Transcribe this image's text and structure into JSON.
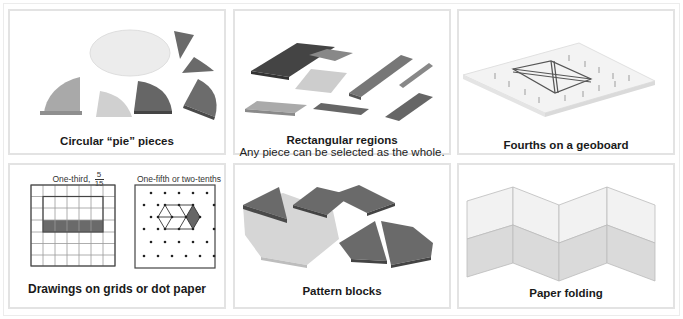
{
  "panels": [
    {
      "id": "pie",
      "caption": "Circular “pie” pieces"
    },
    {
      "id": "rect",
      "caption": "Rectangular regions",
      "subcaption": "Any piece can be selected as the whole."
    },
    {
      "id": "geoboard",
      "caption": "Fourths on a geoboard"
    },
    {
      "id": "grids",
      "caption": "Drawings on grids or dot paper",
      "grid_label": "One-third,",
      "grid_fraction": {
        "numerator": "5",
        "denominator": "15"
      },
      "dot_label": "One-fifth or two-tenths"
    },
    {
      "id": "pattern",
      "caption": "Pattern blocks"
    },
    {
      "id": "folding",
      "caption": "Paper folding"
    }
  ],
  "colors": {
    "dark": "#555555",
    "mid": "#8a8a8a",
    "light": "#c4c4c4",
    "pale": "#e8e8e8",
    "border": "#e3e3e3"
  }
}
